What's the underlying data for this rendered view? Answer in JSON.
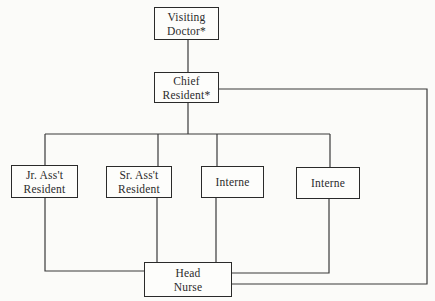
{
  "diagram": {
    "type": "organization-chart",
    "line_color": "#3a3a3a",
    "nodes": {
      "visiting_doctor": {
        "line1": "Visiting",
        "line2": "Doctor*"
      },
      "chief_resident": {
        "line1": "Chief",
        "line2": "Resident*"
      },
      "jr_asst_resident": {
        "line1": "Jr. Ass't",
        "line2": "Resident"
      },
      "sr_asst_resident": {
        "line1": "Sr. Ass't",
        "line2": "Resident"
      },
      "interne_1": {
        "line1": "Interne"
      },
      "interne_2": {
        "line1": "Interne"
      },
      "head_nurse": {
        "line1": "Head",
        "line2": "Nurse"
      }
    },
    "edges": [
      {
        "from": "Visiting Doctor*",
        "to": "Chief Resident*"
      },
      {
        "from": "Chief Resident*",
        "to": "Jr. Ass't Resident"
      },
      {
        "from": "Chief Resident*",
        "to": "Sr. Ass't Resident"
      },
      {
        "from": "Chief Resident*",
        "to": "Interne"
      },
      {
        "from": "Chief Resident*",
        "to": "Interne"
      },
      {
        "from": "Chief Resident*",
        "to": "Head Nurse"
      },
      {
        "from": "Jr. Ass't Resident",
        "to": "Head Nurse"
      },
      {
        "from": "Sr. Ass't Resident",
        "to": "Head Nurse"
      },
      {
        "from": "Interne",
        "to": "Head Nurse"
      },
      {
        "from": "Interne",
        "to": "Head Nurse"
      }
    ]
  }
}
